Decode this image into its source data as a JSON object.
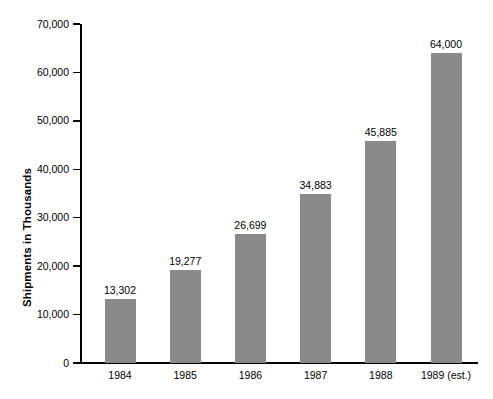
{
  "chart_data": {
    "type": "bar",
    "title": "",
    "subtitle": "",
    "xlabel": "",
    "ylabel": "Shipments in Thousands",
    "categories": [
      "1984",
      "1985",
      "1986",
      "1987",
      "1988",
      "1989 (est.)"
    ],
    "values": [
      13302,
      19277,
      26699,
      34883,
      45885,
      64000
    ],
    "value_labels": [
      "13,302",
      "19,277",
      "26,699",
      "34,883",
      "45,885",
      "64,000"
    ],
    "ylim": [
      0,
      70000
    ],
    "y_ticks": [
      0,
      10000,
      20000,
      30000,
      40000,
      50000,
      60000,
      70000
    ],
    "y_tick_labels": [
      "0",
      "10,000",
      "20,000",
      "30,000",
      "40,000",
      "50,000",
      "60,000",
      "70,000"
    ],
    "grid": false,
    "legend": null,
    "legend_position": "none",
    "bar_color": "#8a8a8a",
    "axis_color": "#000000",
    "background_color": "#ffffff",
    "series": [
      {
        "name": "Shipments in Thousands",
        "values": [
          13302,
          19277,
          26699,
          34883,
          45885,
          64000
        ]
      }
    ]
  }
}
